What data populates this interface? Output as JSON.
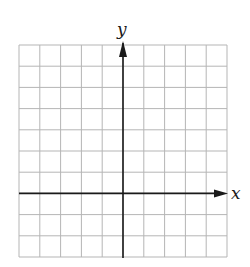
{
  "diagram": {
    "type": "coordinate-grid",
    "x_axis_label": "x",
    "y_axis_label": "y",
    "columns": 10,
    "rows": 10,
    "origin_col": 5,
    "origin_row": 7,
    "colors": {
      "grid": "#b5b5b5",
      "axis": "#1a1a1a",
      "background": "#ffffff"
    }
  }
}
